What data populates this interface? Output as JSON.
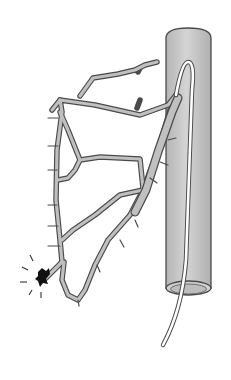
{
  "figure": {
    "type": "medical-illustration",
    "labels": [],
    "colors": {
      "background": "#ffffff",
      "vessel_fill": "#c8c8c8",
      "vessel_outline": "#4a4a4a",
      "branch_fill": "#bdbdbd",
      "catheter_fill": "#ffffff",
      "bleed": "#111111"
    },
    "elements": [
      {
        "name": "large-vessel",
        "description": "vertical cylindrical vessel (aorta) with open bottom end"
      },
      {
        "name": "catheter",
        "description": "thin white catheter entering from below, looping up and into branch artery"
      },
      {
        "name": "branch-artery-tree",
        "description": "grey branching arterial network extending left"
      },
      {
        "name": "bleeding-site",
        "description": "black dark spot with radiating lines at lower-left branch tip"
      }
    ]
  }
}
